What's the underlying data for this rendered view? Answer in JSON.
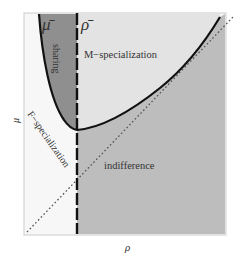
{
  "figure": {
    "axes": {
      "x_label": "ρ",
      "y_label": "μ"
    },
    "markers": {
      "mu_bar": "μ̄",
      "rho_bar": "ρ̄"
    },
    "regions": {
      "sharing": "sharing",
      "m_specialization": "M−specialization",
      "f_specialization": "F−specialization",
      "indifference": "indifference"
    },
    "colors": {
      "sharing_fill": "#8e8e8e",
      "m_specialization_fill": "#e2e2e2",
      "f_specialization_fill": "#f7f7f7",
      "indifference_fill": "#bdbdbd",
      "curve": "#111111",
      "frame": "#d0d0d0"
    },
    "lines": {
      "boundary_curve": "solid threshold curve (U-shaped, minimum at ρ̄)",
      "rho_bar_line": "dashed vertical line at ρ = ρ̄",
      "diagonal": "dotted 45° line μ = ρ"
    }
  }
}
